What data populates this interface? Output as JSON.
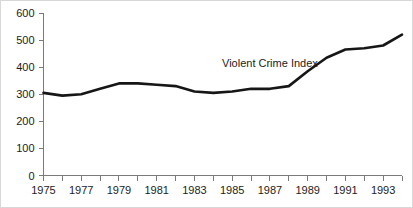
{
  "chart_data": {
    "type": "line",
    "title": "",
    "xlabel": "",
    "ylabel": "",
    "xlim": [
      1975,
      1994
    ],
    "ylim": [
      0,
      600
    ],
    "grid": false,
    "legend": "none",
    "annotations": [
      {
        "text": "Violent Crime Index",
        "x": 1987,
        "y": 400
      }
    ],
    "y_ticks": [
      0,
      100,
      200,
      300,
      400,
      500,
      600
    ],
    "y_tick_labels": [
      "0",
      "100",
      "200",
      "300",
      "400",
      "500",
      "600"
    ],
    "x_ticks": [
      1975,
      1976,
      1977,
      1978,
      1979,
      1980,
      1981,
      1982,
      1983,
      1984,
      1985,
      1986,
      1987,
      1988,
      1989,
      1990,
      1991,
      1992,
      1993,
      1994
    ],
    "x_tick_labels": [
      "1975",
      "",
      "1977",
      "",
      "1979",
      "",
      "1981",
      "",
      "1983",
      "",
      "1985",
      "",
      "1987",
      "",
      "1989",
      "",
      "1991",
      "",
      "1993",
      ""
    ],
    "series": [
      {
        "name": "Violent Crime Index",
        "color": "#161616",
        "x": [
          1975,
          1976,
          1977,
          1978,
          1979,
          1980,
          1981,
          1982,
          1983,
          1984,
          1985,
          1986,
          1987,
          1988,
          1989,
          1990,
          1991,
          1992,
          1993,
          1994
        ],
        "values": [
          305,
          295,
          300,
          320,
          340,
          340,
          335,
          330,
          310,
          305,
          310,
          320,
          320,
          330,
          385,
          435,
          465,
          470,
          480,
          520
        ]
      }
    ]
  },
  "axis": {
    "y_axis_name": "y-axis",
    "x_axis_name": "x-axis"
  }
}
